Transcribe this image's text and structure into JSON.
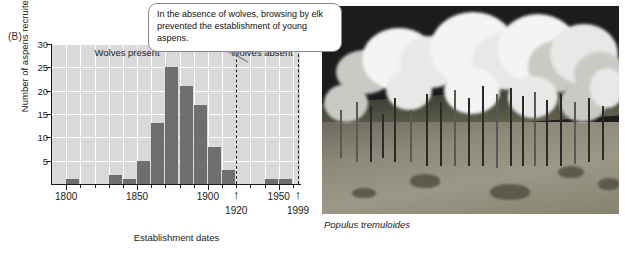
{
  "panel": {
    "label": "(B)"
  },
  "callout": {
    "text": "In the absence of wolves, browsing by elk prevented the establishment of young aspens."
  },
  "photo": {
    "caption": "Populus tremuloides",
    "alt_name": "aspen-grove-photograph"
  },
  "colors": {
    "plot_background": "#d9d9d9",
    "bar_fill": "#6f6f6f",
    "gridline": "#ffffff",
    "axis": "#1a1a1a",
    "callout_border": "#8a8a8a"
  },
  "chart_data": {
    "type": "bar",
    "title": "",
    "xlabel": "Establishment dates",
    "ylabel": "Number of aspens recruited",
    "xlim": [
      1790,
      1965
    ],
    "ylim": [
      0,
      30
    ],
    "grid": true,
    "legend_position": "none",
    "bin_width": 10,
    "categories": [
      1800,
      1810,
      1820,
      1830,
      1840,
      1850,
      1860,
      1870,
      1880,
      1890,
      1900,
      1910,
      1920,
      1930,
      1940,
      1950
    ],
    "values": [
      1,
      0,
      0,
      2,
      1,
      5,
      13,
      25,
      21,
      17,
      8,
      3,
      0,
      0,
      1,
      1
    ],
    "ytick_labels": [
      "5",
      "10",
      "15",
      "20",
      "25",
      "30"
    ],
    "ytick_values": [
      5,
      10,
      15,
      20,
      25,
      30
    ],
    "xtick_labels": [
      "1800",
      "1850",
      "1900",
      "1950"
    ],
    "xtick_values": [
      1800,
      1850,
      1900,
      1950
    ],
    "annotations": [
      {
        "name": "wolves-present-label",
        "text": "Wolves present",
        "x": 1843,
        "y": 28
      },
      {
        "name": "wolves-absent-label",
        "text": "Wolves absent",
        "x": 1938,
        "y": 28
      }
    ],
    "reference_lines": [
      {
        "name": "wolves-extirpated-line",
        "x": 1920,
        "label": "1920",
        "style": "dashed"
      },
      {
        "name": "wolves-reintroduced-line",
        "x": 1999,
        "label": "1999",
        "style": "dashed"
      }
    ]
  }
}
